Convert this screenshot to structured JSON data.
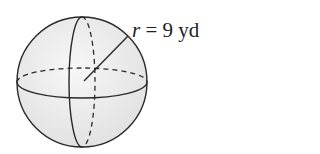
{
  "figure": {
    "shape": "sphere",
    "radius_symbol": "r",
    "equals": "=",
    "radius_value": "9",
    "radius_unit": "yd",
    "fill_color": "#ececec",
    "stroke_color": "#2a2a2a"
  }
}
